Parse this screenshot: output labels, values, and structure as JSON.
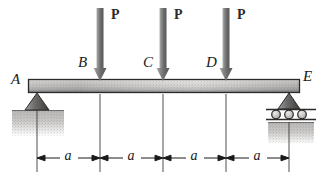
{
  "figure": {
    "kind": "beam-free-body-diagram",
    "width": 322,
    "height": 175,
    "background_color": "#ffffff"
  },
  "beam": {
    "x_left": 28,
    "x_right": 300,
    "y_top": 79,
    "y_bottom": 93,
    "fill_light": "#d6d4d2",
    "fill_dark": "#8d8b89",
    "stroke": "#2a2a2a"
  },
  "node_labels": [
    {
      "id": "A",
      "text": "A",
      "x": 13,
      "y": 78
    },
    {
      "id": "B",
      "text": "B",
      "x": 80,
      "y": 61
    },
    {
      "id": "C",
      "text": "C",
      "x": 145,
      "y": 61
    },
    {
      "id": "D",
      "text": "D",
      "x": 208,
      "y": 61
    },
    {
      "id": "E",
      "text": "E",
      "x": 305,
      "y": 74
    }
  ],
  "loads": [
    {
      "id": "load-b",
      "label": "P",
      "at_node": "B",
      "x": 100,
      "label_x": 113,
      "label_y": 8,
      "arrow_top": 8,
      "arrow_tip": 80
    },
    {
      "id": "load-c",
      "label": "P",
      "at_node": "C",
      "x": 163,
      "label_x": 176,
      "label_y": 8,
      "arrow_top": 8,
      "arrow_tip": 80
    },
    {
      "id": "load-d",
      "label": "P",
      "at_node": "D",
      "x": 226,
      "label_x": 239,
      "label_y": 8,
      "arrow_top": 8,
      "arrow_tip": 80
    }
  ],
  "supports": [
    {
      "id": "support-a",
      "type": "pin",
      "node": "A",
      "x": 37,
      "y": 93,
      "triangle_half_width": 12,
      "triangle_height": 17,
      "ground_x": 12,
      "ground_y": 110,
      "ground_width": 52,
      "ground_height": 26
    },
    {
      "id": "support-e",
      "type": "roller",
      "node": "E",
      "x": 289,
      "y": 93,
      "triangle_half_width": 11,
      "triangle_height": 16,
      "roller_count": 3,
      "roller_radius": 4,
      "plate_x": 266,
      "plate_width": 50,
      "ground_x": 268,
      "ground_y": 122,
      "ground_width": 46,
      "ground_height": 22
    }
  ],
  "dimensions": {
    "line_y": 158,
    "label": "a",
    "ticks": [
      37,
      100,
      163,
      226,
      289
    ],
    "segments": [
      {
        "id": "seg-a-b",
        "label": "a",
        "x_start": 37,
        "x_end": 100,
        "label_x": 68,
        "label_y": 149
      },
      {
        "id": "seg-b-c",
        "label": "a",
        "x_start": 100,
        "x_end": 163,
        "label_x": 131,
        "label_y": 149
      },
      {
        "id": "seg-c-d",
        "label": "a",
        "x_start": 163,
        "x_end": 226,
        "label_x": 194,
        "label_y": 149
      },
      {
        "id": "seg-d-e",
        "label": "a",
        "x_start": 226,
        "x_end": 289,
        "label_x": 257,
        "label_y": 149
      }
    ]
  },
  "colors": {
    "ink": "#1a1a1a",
    "arrow_light": "#9b9b9b",
    "arrow_dark": "#5e5e5e",
    "support_fill_light": "#8e8c8a",
    "support_fill_dark": "#4a4846",
    "ground_fill": "#c9c7c5",
    "roller_fill": "#c0bebc",
    "beam_stroke": "#2a2a2a"
  }
}
